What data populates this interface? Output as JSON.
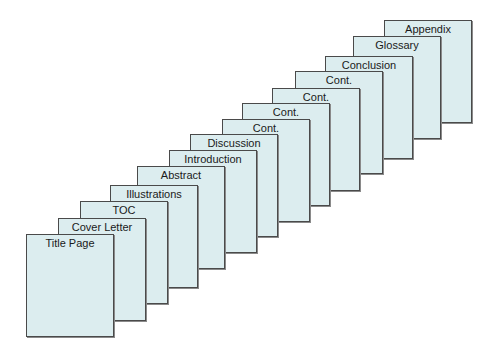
{
  "diagram": {
    "type": "stacked-document-pages",
    "fill_color": "#dcedef",
    "border_color": "#4a4a4a",
    "pages": [
      {
        "label": "Title Page",
        "x": 26,
        "y": 234
      },
      {
        "label": "Cover Letter",
        "x": 58,
        "y": 218
      },
      {
        "label": "TOC",
        "x": 80,
        "y": 201
      },
      {
        "label": "Illustrations",
        "x": 110,
        "y": 185
      },
      {
        "label": "Abstract",
        "x": 137,
        "y": 166
      },
      {
        "label": "Introduction",
        "x": 169,
        "y": 150
      },
      {
        "label": "Discussion",
        "x": 190,
        "y": 134
      },
      {
        "label": "Cont.",
        "x": 222,
        "y": 119
      },
      {
        "label": "Cont.",
        "x": 242,
        "y": 103
      },
      {
        "label": "Cont.",
        "x": 272,
        "y": 88
      },
      {
        "label": "Cont.",
        "x": 295,
        "y": 71
      },
      {
        "label": "Conclusion",
        "x": 325,
        "y": 56
      },
      {
        "label": "Glossary",
        "x": 353,
        "y": 36
      },
      {
        "label": "Appendix",
        "x": 384,
        "y": 20
      }
    ]
  }
}
